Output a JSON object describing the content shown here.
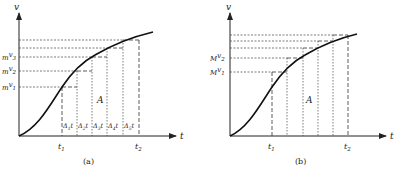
{
  "figures": [
    {
      "id": "a",
      "caption": "(a)",
      "y_axis_label": "v",
      "x_axis_label": "t",
      "area_label": "A",
      "t1_label": "t",
      "t1_sub": "1",
      "t2_label": "t",
      "t2_sub": "2",
      "y_labels": [
        {
          "prefix": "m",
          "var": "v",
          "sub": "1"
        },
        {
          "prefix": "m",
          "var": "v",
          "sub": "2"
        },
        {
          "prefix": "m",
          "var": "v",
          "sub": "3"
        }
      ],
      "delta_labels": [
        {
          "text": "Δ",
          "sub": "1",
          "suffix": "t"
        },
        {
          "text": "Δ",
          "sub": "2",
          "suffix": "t"
        },
        {
          "text": "Δ",
          "sub": "3",
          "suffix": "t"
        },
        {
          "text": "Δ",
          "sub": "4",
          "suffix": "t"
        },
        {
          "text": "Δ",
          "sub": "5",
          "suffix": "t"
        }
      ]
    },
    {
      "id": "b",
      "caption": "(b)",
      "y_axis_label": "v",
      "x_axis_label": "t",
      "area_label": "A",
      "t1_label": "t",
      "t1_sub": "1",
      "t2_label": "t",
      "t2_sub": "2",
      "y_labels": [
        {
          "prefix": "M",
          "var": "v",
          "sub": "1"
        },
        {
          "prefix": "M",
          "var": "v",
          "sub": "2"
        }
      ]
    }
  ],
  "colors": {
    "ink": "#222222",
    "background": "#ffffff"
  }
}
